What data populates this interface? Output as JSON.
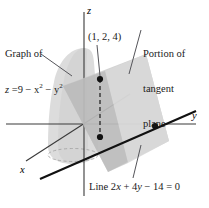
{
  "figure": {
    "name": "tangent-plane-to-paraboloid-diagram",
    "background_color": "#ffffff",
    "axes": {
      "z_label": "z",
      "y_label": "y",
      "x_label": "x"
    },
    "annotations": {
      "graph_label_line1": "Graph of",
      "graph_label_line2_prefix": "z",
      "graph_label_line2_body": " =9 − x",
      "graph_label_exp1": "2",
      "graph_label_line2_mid": " − y",
      "graph_label_exp2": "2",
      "graph_label_plain": "Graph of z =9 − x² − y²",
      "point_label": "(1, 2, 4)",
      "portion_line1": "Portion of",
      "portion_line2": "tangent",
      "portion_line3": "plane",
      "portion_plain": "Portion of tangent plane",
      "line_label_prefix": "Line 2",
      "line_label_x": "x",
      "line_label_mid": " + 4",
      "line_label_y": "y",
      "line_label_suffix": " − 14 = 0",
      "line_label_plain": "Line 2x + 4y − 14 = 0"
    },
    "colors": {
      "axis": "#3a3a3a",
      "heavy_line": "#111111",
      "leader": "#55555a",
      "surface_light": "#d9d9d9",
      "surface_mid": "#c6c6c6",
      "plane_light": "#d2d2d2",
      "plane_dark": "#a9a9a9",
      "dot": "#111111",
      "text": "#1a1a1a"
    },
    "geometry": {
      "origin": {
        "x": 84,
        "y": 124
      },
      "point_upper": {
        "x": 100,
        "y": 79
      },
      "point_lower": {
        "x": 100,
        "y": 137
      },
      "point_on_line": {
        "x": 155,
        "y": 126
      }
    }
  }
}
